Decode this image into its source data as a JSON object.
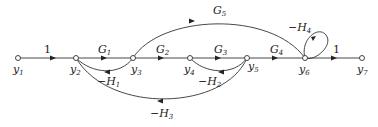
{
  "diagram": {
    "type": "signal-flow-graph",
    "nodes": [
      {
        "id": "y1",
        "label": "y",
        "sub": "1",
        "x": 18,
        "y": 58
      },
      {
        "id": "y2",
        "label": "y",
        "sub": "2",
        "x": 76,
        "y": 58
      },
      {
        "id": "y3",
        "label": "y",
        "sub": "3",
        "x": 133,
        "y": 58
      },
      {
        "id": "y4",
        "label": "y",
        "sub": "4",
        "x": 190,
        "y": 58
      },
      {
        "id": "y5",
        "label": "y",
        "sub": "5",
        "x": 247,
        "y": 58
      },
      {
        "id": "y6",
        "label": "y",
        "sub": "6",
        "x": 305,
        "y": 58
      },
      {
        "id": "y7",
        "label": "y",
        "sub": "7",
        "x": 362,
        "y": 58
      }
    ],
    "edges": [
      {
        "from": "y1",
        "to": "y2",
        "gain": "1"
      },
      {
        "from": "y2",
        "to": "y3",
        "gain": "G",
        "sub": "1"
      },
      {
        "from": "y3",
        "to": "y4",
        "gain": "G",
        "sub": "2"
      },
      {
        "from": "y4",
        "to": "y5",
        "gain": "G",
        "sub": "3"
      },
      {
        "from": "y5",
        "to": "y6",
        "gain": "G",
        "sub": "4"
      },
      {
        "from": "y6",
        "to": "y7",
        "gain": "1"
      },
      {
        "from": "y3",
        "to": "y6",
        "gain": "G",
        "sub": "5"
      },
      {
        "from": "y3",
        "to": "y2",
        "gain": "−H",
        "sub": "1"
      },
      {
        "from": "y5",
        "to": "y4",
        "gain": "−H",
        "sub": "2"
      },
      {
        "from": "y5",
        "to": "y2",
        "gain": "−H",
        "sub": "3"
      },
      {
        "from": "y6",
        "to": "y6",
        "gain": "−H",
        "sub": "4"
      }
    ]
  },
  "labels": {
    "e_y1y2": "1",
    "e_y6y7": "1",
    "G": "G",
    "negH": "−H",
    "s1": "1",
    "s2": "2",
    "s3": "3",
    "s4": "4",
    "s5": "5",
    "s6": "6",
    "s7": "7",
    "y": "y"
  }
}
